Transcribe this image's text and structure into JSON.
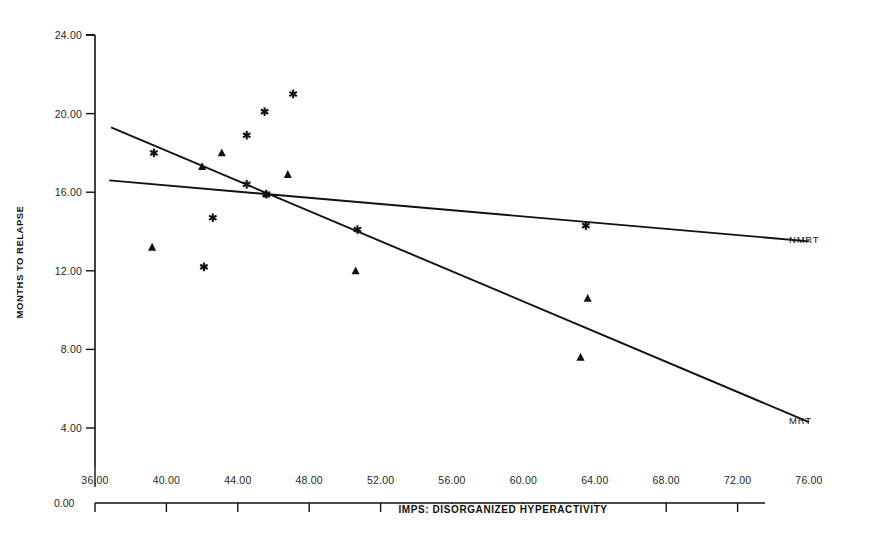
{
  "chart_data": {
    "type": "scatter",
    "title": "",
    "xlabel": "IMPS:  DISORGANIZED HYPERACTIVITY",
    "ylabel": "MONTHS TO RELAPSE",
    "xlim": [
      36.0,
      76.0
    ],
    "ylim": [
      4.0,
      24.0
    ],
    "x_ticks": [
      "36.00",
      "40.00",
      "44.00",
      "48.00",
      "52.00",
      "56.00",
      "60.00",
      "64.00",
      "68.00",
      "72.00",
      "76.00"
    ],
    "x_tick_values": [
      36.0,
      40.0,
      44.0,
      48.0,
      52.0,
      56.0,
      60.0,
      64.0,
      68.0,
      72.0,
      76.0
    ],
    "y_ticks": [
      "24.00",
      "20.00",
      "16.00",
      "12.00",
      "8.00",
      "4.00"
    ],
    "y_tick_values": [
      24.0,
      20.0,
      16.0,
      12.0,
      8.0,
      4.0
    ],
    "origin_label": "0.00",
    "grid": false,
    "legend_position": "right-inline",
    "series": [
      {
        "name": "NMRT",
        "label": "NMRT",
        "marker": "asterisk",
        "color": "#111111",
        "points": [
          {
            "x": 39.3,
            "y": 18.0
          },
          {
            "x": 42.1,
            "y": 12.2
          },
          {
            "x": 42.6,
            "y": 14.7
          },
          {
            "x": 44.5,
            "y": 18.9
          },
          {
            "x": 44.5,
            "y": 16.4
          },
          {
            "x": 45.5,
            "y": 20.1
          },
          {
            "x": 47.1,
            "y": 21.0
          },
          {
            "x": 45.6,
            "y": 15.9
          },
          {
            "x": 50.7,
            "y": 14.1
          },
          {
            "x": 63.5,
            "y": 14.3
          }
        ],
        "fit_line": {
          "x1": 36.8,
          "y1": 16.6,
          "x2": 76.0,
          "y2": 13.5
        }
      },
      {
        "name": "MRT",
        "label": "MRT",
        "marker": "triangle",
        "color": "#111111",
        "points": [
          {
            "x": 39.2,
            "y": 13.2
          },
          {
            "x": 42.0,
            "y": 17.3
          },
          {
            "x": 43.1,
            "y": 18.0
          },
          {
            "x": 45.6,
            "y": 15.9
          },
          {
            "x": 46.8,
            "y": 16.9
          },
          {
            "x": 50.6,
            "y": 12.0
          },
          {
            "x": 63.6,
            "y": 10.6
          },
          {
            "x": 63.2,
            "y": 7.6
          }
        ],
        "fit_line": {
          "x1": 36.9,
          "y1": 19.3,
          "x2": 76.0,
          "y2": 4.3
        }
      }
    ]
  }
}
